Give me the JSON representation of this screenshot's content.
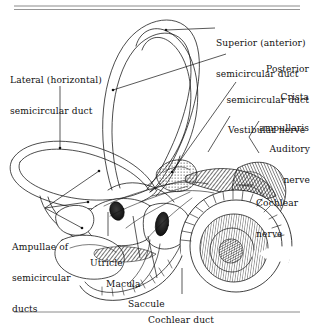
{
  "figure": {
    "ink_color": "#111111",
    "rule_color": "#8a8a8a",
    "background": "#ffffff",
    "line_weight": 0.7
  },
  "rules": {
    "top_rule_count": 2,
    "bottom_rule_count": 1
  },
  "labels": [
    {
      "id": "superior-duct",
      "line1": "Superior (anterior)",
      "line2": "semicircular duct",
      "align": "left"
    },
    {
      "id": "posterior-duct",
      "line1": "Posterior",
      "line2": "semicircular duct",
      "align": "right"
    },
    {
      "id": "crista",
      "line1": "Crista",
      "line2": "ampullaris",
      "align": "right"
    },
    {
      "id": "vestibular-nerve",
      "line1": "Vestibular nerve",
      "line2": "",
      "align": "left"
    },
    {
      "id": "auditory-nerve",
      "line1": "Auditory",
      "line2": "nerve",
      "align": "right"
    },
    {
      "id": "cochlear-nerve",
      "line1": "Cochlear",
      "line2": "nerve",
      "align": "left"
    },
    {
      "id": "lateral-duct",
      "line1": "Lateral (horizontal)",
      "line2": "semicircular duct",
      "align": "left"
    },
    {
      "id": "ampullae",
      "line1": "Ampullae of",
      "line2": "semicircular",
      "line3": "ducts",
      "align": "left"
    },
    {
      "id": "utricle",
      "line1": "Utricle",
      "line2": "",
      "align": "left"
    },
    {
      "id": "macula",
      "line1": "Macula",
      "line2": "",
      "align": "left"
    },
    {
      "id": "saccule",
      "line1": "Saccule",
      "line2": "",
      "align": "left"
    },
    {
      "id": "cochlear-duct",
      "line1": "Cochlear duct",
      "line2": "",
      "align": "left"
    }
  ],
  "structures": {
    "superior_semicircular_duct": "large upper loop",
    "posterior_semicircular_duct": "rear loop descending to ampulla",
    "lateral_semicircular_duct": "flattened left loop",
    "utricle": "oval vestibular sac",
    "saccule": "smaller vestibular sac",
    "maculae": "two dark oval sensory patches",
    "cochlea": "spiral of two and one half turns",
    "vestibular_nerve": "hatched nerve trunk entering ampullae",
    "cochlear_nerve": "hatched nerve trunk entering cochlear base"
  }
}
